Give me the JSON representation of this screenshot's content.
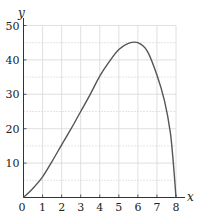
{
  "chart_data": {
    "type": "line",
    "title": "",
    "xlabel": "x",
    "ylabel": "y",
    "xlim": [
      0,
      8
    ],
    "ylim": [
      0,
      50
    ],
    "grid": true,
    "x_ticks": [
      0,
      1,
      2,
      3,
      4,
      5,
      6,
      7,
      8
    ],
    "y_ticks": [
      10,
      20,
      30,
      40,
      50
    ],
    "series": [
      {
        "name": "y(x)",
        "color": "#555555",
        "x": [
          0,
          0.5,
          1,
          1.5,
          2,
          2.5,
          3,
          3.5,
          4,
          4.5,
          5,
          5.5,
          6,
          6.5,
          7,
          7.4,
          7.7,
          7.86,
          8
        ],
        "y": [
          0,
          2.7,
          6,
          10.5,
          15.3,
          20,
          25,
          30,
          35.3,
          39.5,
          43,
          44.8,
          45,
          42.5,
          35.6,
          28,
          19,
          10,
          0
        ]
      }
    ]
  },
  "axes": {
    "x_label": "x",
    "y_label": "y",
    "x_tick_labels": [
      "0",
      "1",
      "2",
      "3",
      "4",
      "5",
      "6",
      "7",
      "8"
    ],
    "y_tick_labels": [
      "10",
      "20",
      "30",
      "40",
      "50"
    ]
  }
}
